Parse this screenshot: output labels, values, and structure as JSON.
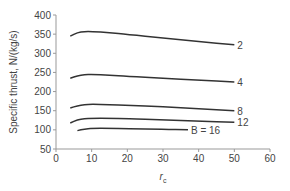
{
  "chart_data": {
    "type": "line",
    "title": "",
    "xlabel": "r_c",
    "ylabel": "Specific thrust, N/(kg/s)",
    "xlim": [
      0,
      60
    ],
    "ylim": [
      50,
      400
    ],
    "xticks": [
      0,
      10,
      20,
      30,
      40,
      50,
      60
    ],
    "yticks": [
      50,
      100,
      150,
      200,
      250,
      300,
      350,
      400
    ],
    "grid": false,
    "legend": "inline labels at curve ends",
    "series": [
      {
        "name": "2",
        "label": "2",
        "x": [
          4,
          6,
          8,
          10,
          15,
          20,
          30,
          40,
          50
        ],
        "values": [
          345,
          354,
          357,
          357,
          354,
          349,
          340,
          331,
          322
        ]
      },
      {
        "name": "4",
        "label": "4",
        "x": [
          4,
          6,
          8,
          10,
          15,
          20,
          30,
          40,
          50
        ],
        "values": [
          235,
          241,
          244,
          245,
          243,
          240,
          235,
          230,
          225
        ]
      },
      {
        "name": "8",
        "label": "8",
        "x": [
          4,
          6,
          8,
          10,
          15,
          20,
          30,
          40,
          50
        ],
        "values": [
          157,
          163,
          166,
          167,
          166,
          164,
          160,
          155,
          150
        ]
      },
      {
        "name": "12",
        "label": "12",
        "x": [
          4,
          6,
          8,
          10,
          15,
          20,
          30,
          40,
          50
        ],
        "values": [
          118,
          126,
          129,
          130,
          130,
          129,
          126,
          123,
          120
        ]
      },
      {
        "name": "16",
        "label": "B = 16",
        "x": [
          6,
          8,
          10,
          15,
          20,
          30,
          37
        ],
        "values": [
          98,
          102,
          104,
          104,
          103,
          102,
          100
        ]
      }
    ]
  }
}
